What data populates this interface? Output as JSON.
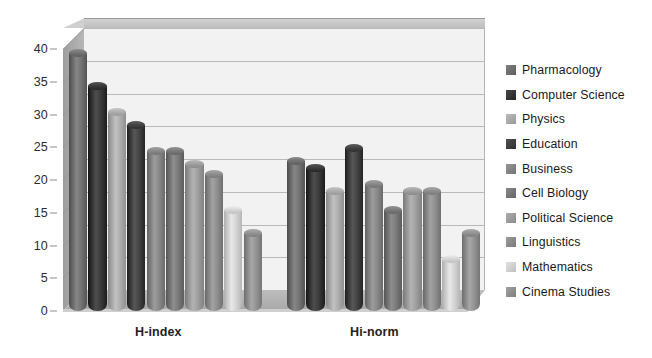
{
  "chart_data": {
    "type": "bar",
    "title": "",
    "subtitle": "",
    "xlabel": "",
    "ylabel": "",
    "categories": [
      "H-index",
      "Hi-norm"
    ],
    "ylim": [
      0,
      40
    ],
    "yticks": [
      0,
      5,
      10,
      15,
      20,
      25,
      30,
      35,
      40
    ],
    "ytick_labels": [
      "0",
      "5",
      "10",
      "15",
      "20",
      "25",
      "30",
      "35",
      "40"
    ],
    "grid": true,
    "legend_position": "right",
    "style": "3d-cylinder-grouped",
    "series": [
      {
        "name": "Pharmacology",
        "color": "#6e6e6e",
        "values": [
          40.0,
          23.5
        ]
      },
      {
        "name": "Computer Science",
        "color": "#363636",
        "values": [
          35.0,
          22.5
        ]
      },
      {
        "name": "Physics",
        "color": "#a9a9a9",
        "values": [
          31.0,
          19.0
        ]
      },
      {
        "name": "Education",
        "color": "#3f3f3f",
        "values": [
          29.0,
          25.5
        ]
      },
      {
        "name": "Business",
        "color": "#848484",
        "values": [
          25.0,
          20.0
        ]
      },
      {
        "name": "Cell Biology",
        "color": "#767676",
        "values": [
          25.0,
          16.0
        ]
      },
      {
        "name": "Political Science",
        "color": "#9b9b9b",
        "values": [
          23.0,
          19.0
        ]
      },
      {
        "name": "Linguistics",
        "color": "#8a8a8a",
        "values": [
          21.5,
          19.0
        ]
      },
      {
        "name": "Mathematics",
        "color": "#d0d0d0",
        "values": [
          16.0,
          8.5
        ]
      },
      {
        "name": "Cinema Studies",
        "color": "#8f8f8f",
        "values": [
          12.5,
          12.5
        ]
      }
    ]
  },
  "legend": {
    "items": [
      {
        "label": "Pharmacology",
        "color": "#6e6e6e"
      },
      {
        "label": "Computer Science",
        "color": "#363636"
      },
      {
        "label": "Physics",
        "color": "#a9a9a9"
      },
      {
        "label": "Education",
        "color": "#3f3f3f"
      },
      {
        "label": "Business",
        "color": "#848484"
      },
      {
        "label": "Cell Biology",
        "color": "#767676"
      },
      {
        "label": "Political Science",
        "color": "#9b9b9b"
      },
      {
        "label": "Linguistics",
        "color": "#8a8a8a"
      },
      {
        "label": "Mathematics",
        "color": "#d0d0d0"
      },
      {
        "label": "Cinema Studies",
        "color": "#8f8f8f"
      }
    ]
  },
  "axis": {
    "y_tick_labels": [
      "40",
      "35",
      "30",
      "25",
      "20",
      "15",
      "10",
      "5",
      "0"
    ],
    "category_labels": [
      "H-index",
      "Hi-norm"
    ]
  },
  "colors": {
    "plot_background": "#f2f2f2",
    "wall": "#cfcfcf",
    "floor": "#b4b4b4",
    "gridline": "#b9b9b9",
    "text": "#1f1f1f"
  }
}
